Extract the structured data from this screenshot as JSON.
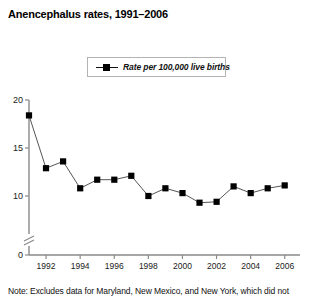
{
  "title": "Anencephalus rates, 1991–2006",
  "legend": {
    "label": "Rate per 100,000 live births",
    "marker": "square-marker-icon",
    "marker_color": "#000000"
  },
  "note": "Note: Excludes data for Maryland, New Mexico, and New York, which did not",
  "axes": {
    "y_ticks": [
      "0",
      "10",
      "15",
      "20"
    ],
    "x_ticks": [
      "1992",
      "1994",
      "1996",
      "1998",
      "2000",
      "2002",
      "2004",
      "2006"
    ],
    "y_axis_break": true
  },
  "chart_data": {
    "type": "line",
    "title": "Anencephalus rates, 1991–2006",
    "xlabel": "",
    "ylabel": "",
    "ylim": [
      9,
      20
    ],
    "y_ticks": [
      10,
      15,
      20
    ],
    "y_axis_break_below": 10,
    "grid": false,
    "legend_position": "top-center",
    "x": [
      1991,
      1992,
      1993,
      1994,
      1995,
      1996,
      1997,
      1998,
      1999,
      2000,
      2001,
      2002,
      2003,
      2004,
      2005,
      2006
    ],
    "x_tick_labels": [
      1992,
      1994,
      1996,
      1998,
      2000,
      2002,
      2004,
      2006
    ],
    "series": [
      {
        "name": "Rate per 100,000 live births",
        "marker": "square",
        "color": "#000000",
        "values": [
          18.4,
          12.9,
          13.6,
          10.8,
          11.7,
          11.7,
          12.1,
          10.0,
          10.8,
          10.3,
          9.3,
          9.4,
          11.0,
          10.3,
          10.8,
          11.1
        ]
      }
    ],
    "annotations": [
      "Note: Excludes data for Maryland, New Mexico, and New York, which did not"
    ]
  }
}
